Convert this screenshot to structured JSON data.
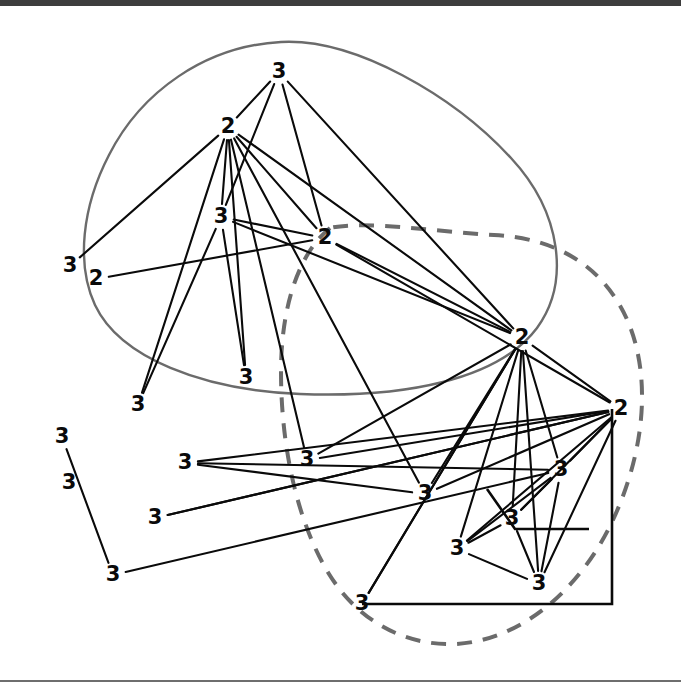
{
  "figure": {
    "kind": "graph-drawing",
    "background": "#ffffff",
    "top_bar_color": "#3d3d3d",
    "bottom_rule_color": "#6e6e6e",
    "edge_color": "#0a0a0a",
    "region_solid_color": "#6b6b6b",
    "region_dashed_color": "#6b6b6b",
    "node_label_color": "#0a0a0a"
  },
  "chart_data": {
    "type": "scatter",
    "title": "",
    "xlabel": "",
    "ylabel": "",
    "xlim": [
      0,
      681
    ],
    "ylim": [
      0,
      688
    ],
    "grid": false,
    "legend": "none",
    "nodes": [
      {
        "id": "n0",
        "label": "3",
        "x": 279,
        "y": 72
      },
      {
        "id": "n1",
        "label": "2",
        "x": 228,
        "y": 127
      },
      {
        "id": "n2",
        "label": "3",
        "x": 221,
        "y": 217
      },
      {
        "id": "n3",
        "label": "2",
        "x": 325,
        "y": 238
      },
      {
        "id": "n4",
        "label": "3",
        "x": 70,
        "y": 266
      },
      {
        "id": "n5",
        "label": "2",
        "x": 96,
        "y": 279
      },
      {
        "id": "n6",
        "label": "2",
        "x": 522,
        "y": 338
      },
      {
        "id": "n7",
        "label": "3",
        "x": 246,
        "y": 378
      },
      {
        "id": "n8",
        "label": "3",
        "x": 138,
        "y": 405
      },
      {
        "id": "n9",
        "label": "2",
        "x": 621,
        "y": 409
      },
      {
        "id": "n10",
        "label": "3",
        "x": 62,
        "y": 437
      },
      {
        "id": "n11",
        "label": "3",
        "x": 307,
        "y": 460
      },
      {
        "id": "n12",
        "label": "3",
        "x": 185,
        "y": 463
      },
      {
        "id": "n13",
        "label": "3",
        "x": 69,
        "y": 483
      },
      {
        "id": "n14",
        "label": "3",
        "x": 425,
        "y": 494
      },
      {
        "id": "n15",
        "label": "3",
        "x": 561,
        "y": 470
      },
      {
        "id": "n16",
        "label": "3",
        "x": 155,
        "y": 518
      },
      {
        "id": "n17",
        "label": "3",
        "x": 512,
        "y": 519
      },
      {
        "id": "n18",
        "label": "3",
        "x": 457,
        "y": 549
      },
      {
        "id": "n19",
        "label": "3",
        "x": 113,
        "y": 575
      },
      {
        "id": "n20",
        "label": "3",
        "x": 539,
        "y": 584
      },
      {
        "id": "n21",
        "label": "3",
        "x": 362,
        "y": 604
      }
    ],
    "edges": [
      [
        "n0",
        "n1"
      ],
      [
        "n0",
        "n2"
      ],
      [
        "n0",
        "n3"
      ],
      [
        "n0",
        "n6"
      ],
      [
        "n1",
        "n2"
      ],
      [
        "n1",
        "n3"
      ],
      [
        "n1",
        "n4"
      ],
      [
        "n1",
        "n6"
      ],
      [
        "n1",
        "n7"
      ],
      [
        "n1",
        "n8"
      ],
      [
        "n1",
        "n11"
      ],
      [
        "n1",
        "n14"
      ],
      [
        "n2",
        "n3"
      ],
      [
        "n2",
        "n6"
      ],
      [
        "n2",
        "n7"
      ],
      [
        "n2",
        "n8"
      ],
      [
        "n3",
        "n5"
      ],
      [
        "n3",
        "n6"
      ],
      [
        "n3",
        "n9"
      ],
      [
        "n6",
        "n9"
      ],
      [
        "n6",
        "n11"
      ],
      [
        "n6",
        "n14"
      ],
      [
        "n6",
        "n15"
      ],
      [
        "n6",
        "n17"
      ],
      [
        "n6",
        "n18"
      ],
      [
        "n6",
        "n20"
      ],
      [
        "n6",
        "n21"
      ],
      [
        "n9",
        "n11"
      ],
      [
        "n9",
        "n14"
      ],
      [
        "n9",
        "n15"
      ],
      [
        "n9",
        "n17"
      ],
      [
        "n9",
        "n18"
      ],
      [
        "n9",
        "n20"
      ],
      [
        "n9",
        "n12"
      ],
      [
        "n9",
        "n16"
      ],
      [
        "n10",
        "n19"
      ],
      [
        "n12",
        "n15"
      ],
      [
        "n12",
        "n14"
      ],
      [
        "n15",
        "n17"
      ],
      [
        "n15",
        "n18"
      ],
      [
        "n15",
        "n20"
      ],
      [
        "n17",
        "n18"
      ],
      [
        "n17",
        "n20"
      ],
      [
        "n18",
        "n20"
      ],
      [
        "n19",
        "n15"
      ],
      [
        "n21",
        "n6"
      ],
      [
        "n16",
        "n9"
      ]
    ],
    "regions": [
      {
        "id": "region-solid",
        "style": "solid",
        "label": ""
      },
      {
        "id": "region-dashed",
        "style": "dashed",
        "label": ""
      },
      {
        "id": "region-black-polygon",
        "style": "solid",
        "label": ""
      }
    ]
  }
}
